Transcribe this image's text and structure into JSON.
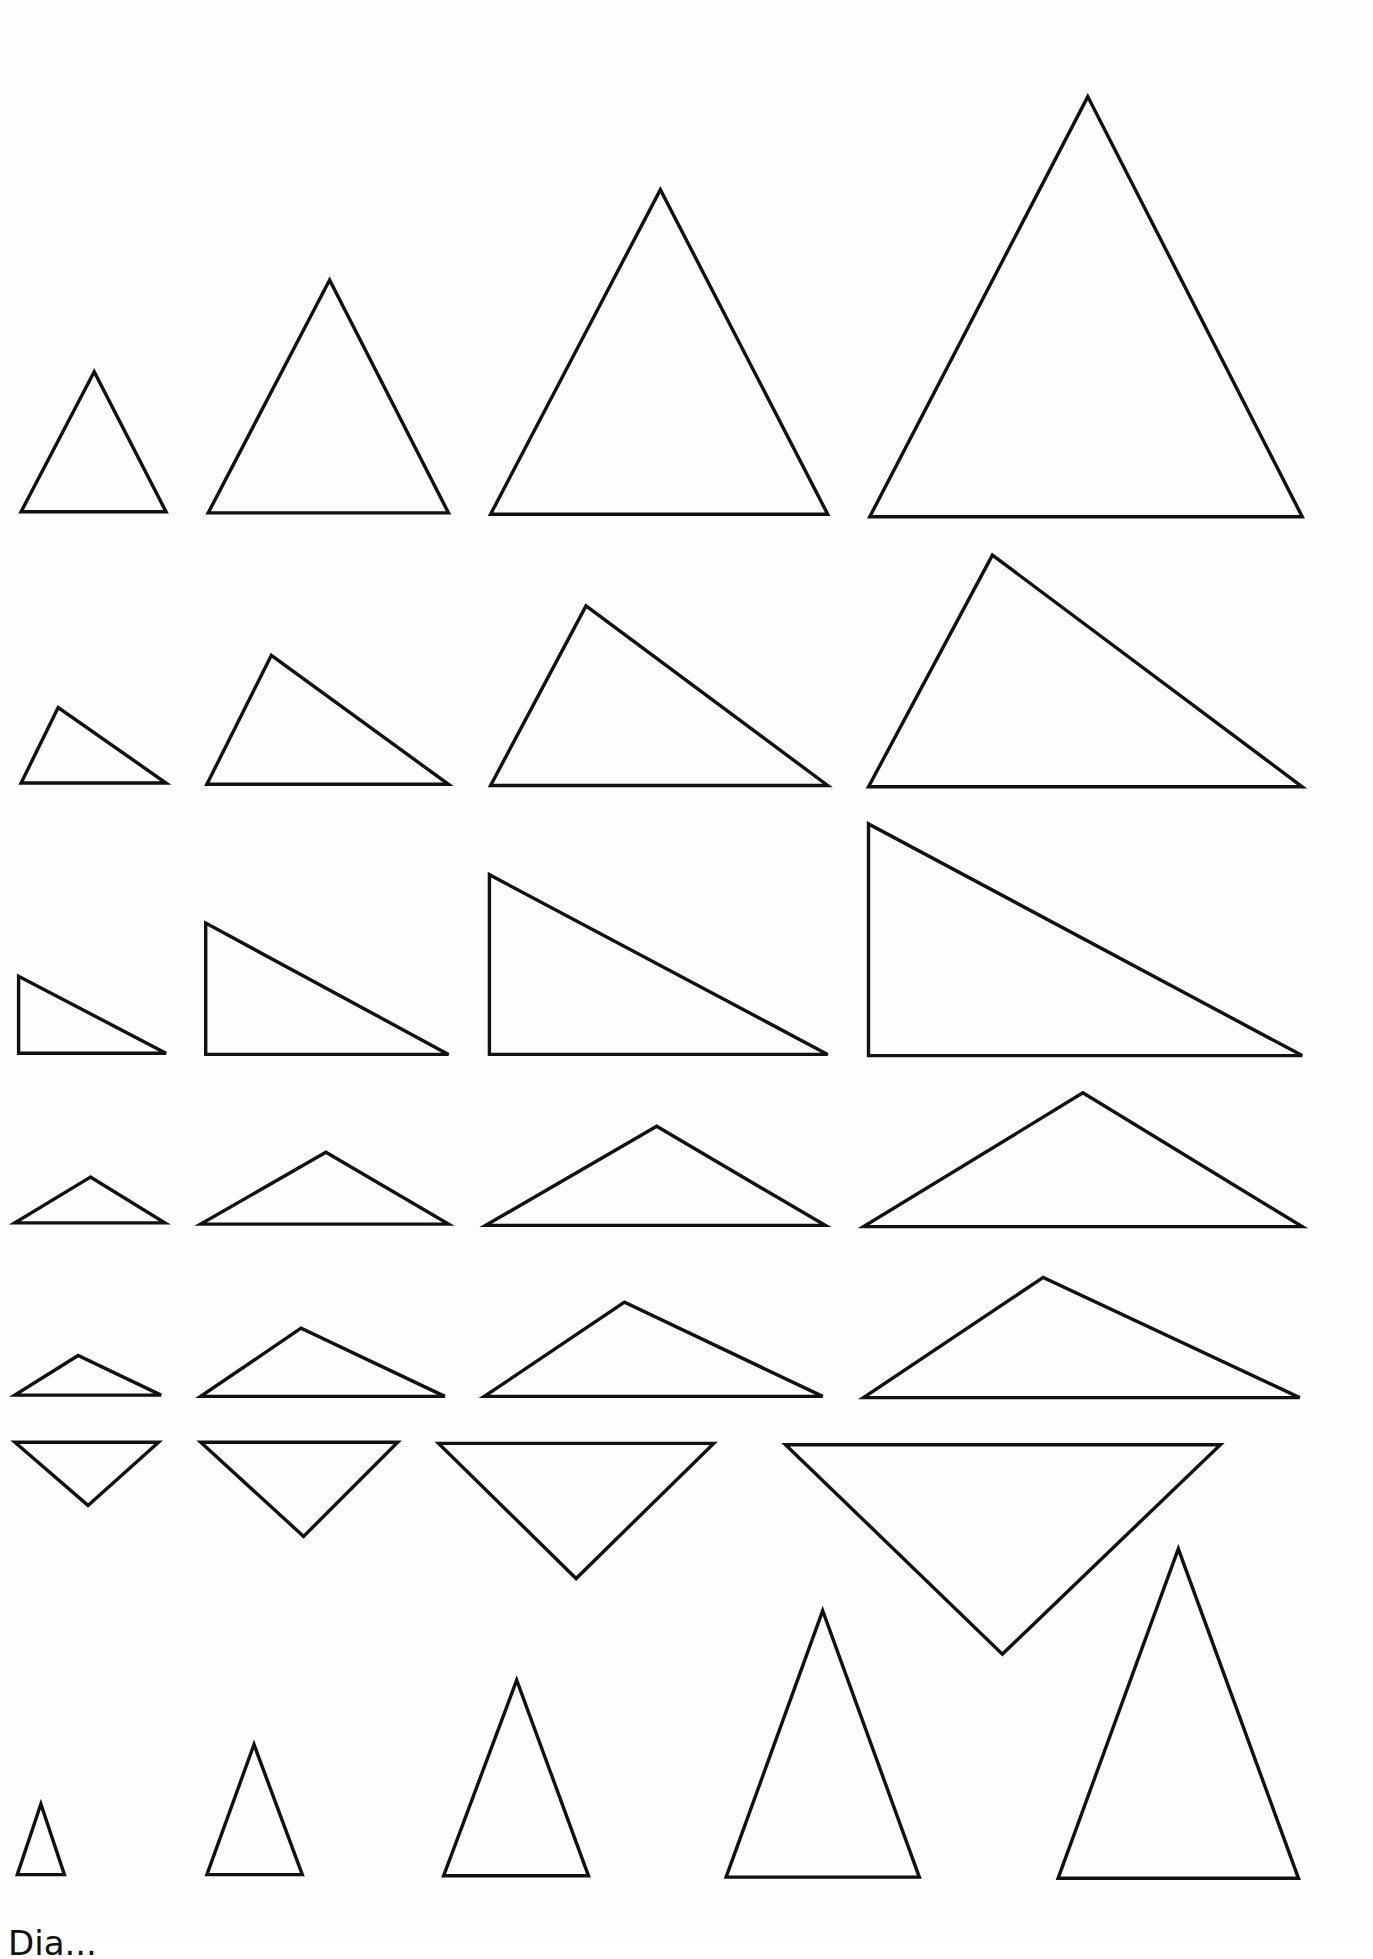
{
  "page": {
    "background": "#fdfdfd",
    "stroke_color": "#111111",
    "scale": 1.239
  },
  "rows": [
    {
      "name": "row-1-acute-isosceles",
      "triangles": [
        [
          [
            76,
            300
          ],
          [
            17,
            413
          ],
          [
            134,
            413
          ]
        ],
        [
          [
            266,
            226
          ],
          [
            168,
            414
          ],
          [
            362,
            414
          ]
        ],
        [
          [
            533,
            153
          ],
          [
            396,
            415
          ],
          [
            668,
            415
          ]
        ],
        [
          [
            878,
            78
          ],
          [
            702,
            417
          ],
          [
            1051,
            417
          ]
        ]
      ]
    },
    {
      "name": "row-2-scalene",
      "triangles": [
        [
          [
            47,
            571
          ],
          [
            17,
            632
          ],
          [
            134,
            632
          ]
        ],
        [
          [
            219,
            529
          ],
          [
            167,
            633
          ],
          [
            362,
            633
          ]
        ],
        [
          [
            473,
            489
          ],
          [
            396,
            634
          ],
          [
            668,
            634
          ]
        ],
        [
          [
            801,
            448
          ],
          [
            701,
            635
          ],
          [
            1051,
            635
          ]
        ]
      ]
    },
    {
      "name": "row-3-right",
      "triangles": [
        [
          [
            15,
            788
          ],
          [
            15,
            850
          ],
          [
            134,
            850
          ]
        ],
        [
          [
            166,
            745
          ],
          [
            166,
            851
          ],
          [
            362,
            851
          ]
        ],
        [
          [
            395,
            706
          ],
          [
            395,
            851
          ],
          [
            668,
            851
          ]
        ],
        [
          [
            701,
            665
          ],
          [
            701,
            852
          ],
          [
            1051,
            852
          ]
        ]
      ]
    },
    {
      "name": "row-4-obtuse-isosceles",
      "triangles": [
        [
          [
            73,
            950
          ],
          [
            12,
            987
          ],
          [
            133,
            987
          ]
        ],
        [
          [
            263,
            930
          ],
          [
            162,
            988
          ],
          [
            362,
            988
          ]
        ],
        [
          [
            530,
            909
          ],
          [
            392,
            989
          ],
          [
            666,
            989
          ]
        ],
        [
          [
            874,
            882
          ],
          [
            697,
            990
          ],
          [
            1051,
            990
          ]
        ]
      ]
    },
    {
      "name": "row-5-obtuse-scalene",
      "triangles": [
        [
          [
            63,
            1094
          ],
          [
            12,
            1126
          ],
          [
            130,
            1126
          ]
        ],
        [
          [
            243,
            1072
          ],
          [
            162,
            1127
          ],
          [
            359,
            1127
          ]
        ],
        [
          [
            504,
            1051
          ],
          [
            391,
            1127
          ],
          [
            664,
            1127
          ]
        ],
        [
          [
            842,
            1031
          ],
          [
            697,
            1128
          ],
          [
            1049,
            1128
          ]
        ]
      ]
    },
    {
      "name": "row-6-inverted",
      "triangles": [
        [
          [
            12,
            1164
          ],
          [
            128,
            1164
          ],
          [
            71,
            1215
          ]
        ],
        [
          [
            162,
            1164
          ],
          [
            321,
            1164
          ],
          [
            245,
            1240
          ]
        ],
        [
          [
            354,
            1165
          ],
          [
            576,
            1165
          ],
          [
            465,
            1274
          ]
        ],
        [
          [
            634,
            1166
          ],
          [
            985,
            1166
          ],
          [
            809,
            1335
          ]
        ]
      ]
    },
    {
      "name": "row-7-tall-isosceles",
      "triangles": [
        [
          [
            33,
            1456
          ],
          [
            14,
            1513
          ],
          [
            52,
            1513
          ]
        ],
        [
          [
            205,
            1408
          ],
          [
            167,
            1513
          ],
          [
            244,
            1513
          ]
        ],
        [
          [
            417,
            1356
          ],
          [
            358,
            1514
          ],
          [
            475,
            1514
          ]
        ],
        [
          [
            664,
            1300
          ],
          [
            586,
            1515
          ],
          [
            742,
            1515
          ]
        ],
        [
          [
            951,
            1250
          ],
          [
            854,
            1516
          ],
          [
            1048,
            1516
          ]
        ]
      ]
    }
  ],
  "footer": {
    "text": "Dia..."
  }
}
